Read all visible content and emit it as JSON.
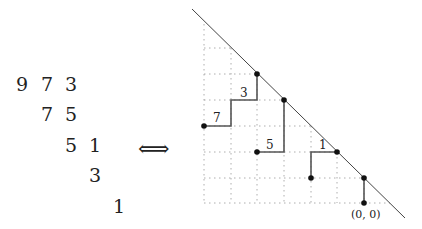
{
  "triangle": {
    "rows": [
      [
        "9",
        "7",
        "3"
      ],
      [
        "7",
        "5"
      ],
      [
        "5",
        "1"
      ],
      [
        "3"
      ],
      [
        "1"
      ]
    ]
  },
  "equivalence_symbol": "⟺",
  "path_diagram": {
    "edge_labels": [
      "7",
      "3",
      "5",
      "1"
    ],
    "origin_label": "(0, 0)",
    "line_color": "#555555",
    "grid_color": "#999999"
  }
}
